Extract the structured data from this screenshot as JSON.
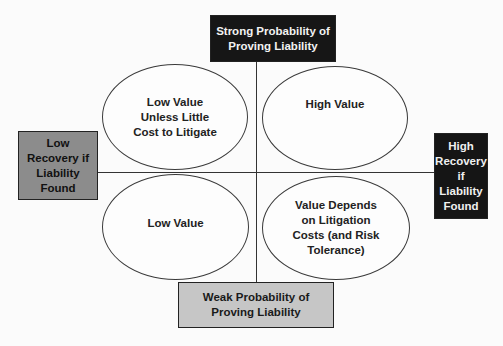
{
  "diagram": {
    "type": "2x2 quadrant matrix",
    "axes": {
      "top": {
        "label": "Strong Probability of\nProving Liability",
        "fill": "#161616",
        "text_color": "#f2f2f2"
      },
      "bottom": {
        "label": "Weak Probability  of\nProving Liability",
        "fill": "#c6c6c6",
        "text_color": "#1a1a1a"
      },
      "left": {
        "label": "Low\nRecovery if\nLiability\nFound",
        "fill": "#8c8c8c",
        "text_color": "#111111"
      },
      "right": {
        "label": "High\nRecovery if\nLiability\nFound",
        "fill": "#151515",
        "text_color": "#f0f0f0"
      }
    },
    "quadrants": {
      "top_left": {
        "label": "Low Value\nUnless Little\nCost to Litigate"
      },
      "top_right": {
        "label": "High Value"
      },
      "bottom_left": {
        "label": "Low Value"
      },
      "bottom_right": {
        "label": "Value Depends\non Litigation\nCosts (and Risk\nTolerance)"
      }
    }
  }
}
